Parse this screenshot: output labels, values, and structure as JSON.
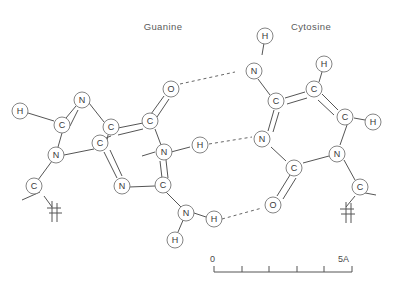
{
  "diagram": {
    "title_left": "Guanine",
    "title_right": "Cytosine",
    "scale": {
      "left_label": "0",
      "right_label": "5A",
      "ticks": 5
    },
    "atoms": [
      {
        "id": "g-h-left",
        "label": "H"
      },
      {
        "id": "g-n-top",
        "label": "N"
      },
      {
        "id": "g-c-left",
        "label": "C"
      },
      {
        "id": "g-c-mid",
        "label": "C"
      },
      {
        "id": "g-c-top",
        "label": "C"
      },
      {
        "id": "g-o-top",
        "label": "O"
      },
      {
        "id": "g-n-low",
        "label": "N"
      },
      {
        "id": "g-c-low",
        "label": "C"
      },
      {
        "id": "g-n-bottomleft",
        "label": "N"
      },
      {
        "id": "g-c-bridge",
        "label": "C"
      },
      {
        "id": "g-n-ring",
        "label": "N"
      },
      {
        "id": "g-n-bottom",
        "label": "N"
      },
      {
        "id": "g-h-bottom",
        "label": "H"
      },
      {
        "id": "g-h-mid",
        "label": "H"
      },
      {
        "id": "g-c-sugar",
        "label": "C"
      },
      {
        "id": "c-h-top",
        "label": "H"
      },
      {
        "id": "c-n-top",
        "label": "N"
      },
      {
        "id": "c-c-top",
        "label": "C"
      },
      {
        "id": "c-c-right",
        "label": "C"
      },
      {
        "id": "c-h-right",
        "label": "H"
      },
      {
        "id": "c-c-rightlow",
        "label": "C"
      },
      {
        "id": "c-h-rightlow",
        "label": "H"
      },
      {
        "id": "c-n-mid",
        "label": "N"
      },
      {
        "id": "c-c-mid",
        "label": "C"
      },
      {
        "id": "c-o-low",
        "label": "O"
      },
      {
        "id": "c-n-low",
        "label": "N"
      },
      {
        "id": "c-c-sugar",
        "label": "C"
      },
      {
        "id": "c-h-bond",
        "label": "H"
      }
    ]
  }
}
